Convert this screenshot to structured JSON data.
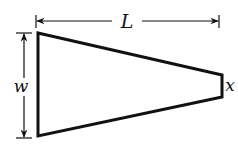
{
  "diagram": {
    "type": "tapered-plate",
    "shape": {
      "name": "trapezoid",
      "vertices": [
        [
          38,
          33
        ],
        [
          222,
          75
        ],
        [
          222,
          97
        ],
        [
          38,
          136
        ]
      ],
      "stroke": "#111111",
      "stroke_width": 3,
      "fill": "#ffffff"
    },
    "dimensions": {
      "length": {
        "label": "L",
        "x1": 36,
        "x2": 219,
        "y": 21,
        "label_x": 124,
        "label_y": 28
      },
      "width": {
        "label": "w",
        "x": 24,
        "y1": 34,
        "y2": 138,
        "label_x": 20,
        "label_y": 91
      },
      "tip": {
        "label": "x",
        "label_x": 229,
        "label_y": 91
      }
    },
    "colors": {
      "line": "#111111",
      "background": "#ffffff"
    }
  }
}
